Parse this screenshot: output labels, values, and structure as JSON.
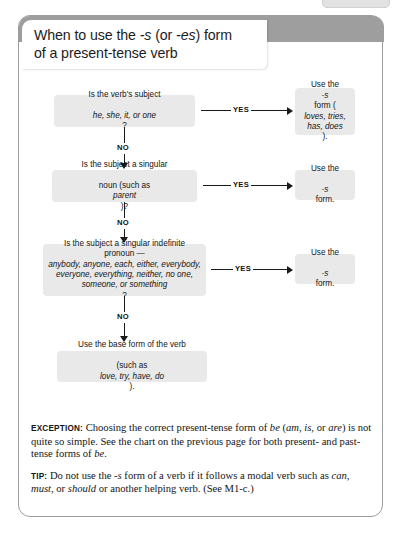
{
  "card": {
    "title_line1_a": "When to use the ",
    "title_line1_s": "-s",
    "title_line1_b": " (or ",
    "title_line1_es": "-es",
    "title_line1_c": ") form",
    "title_line2": "of a present-tense verb",
    "title_full": "When to use the -s (or -es) form of a present-tense verb"
  },
  "flowchart": {
    "type": "decision-flowchart",
    "yes_label": "YES",
    "no_label": "NO",
    "nodes": [
      {
        "id": "q1",
        "kind": "question",
        "line1": "Is the verb's subject",
        "line2_italic": "he, she, it, or one",
        "line2_tail": "?",
        "text": "Is the verb's subject he, she, it, or one?"
      },
      {
        "id": "r1",
        "kind": "result",
        "lead": "Use the ",
        "italic1": "-s",
        "mid": " form (",
        "italic2": "loves, tries, has, does",
        "tail": ").",
        "text": "Use the -s form (loves, tries, has, does)."
      },
      {
        "id": "q2",
        "kind": "question",
        "line1": "Is the subject a singular",
        "line2_a": "noun (such as ",
        "line2_italic": "parent",
        "line2_b": ")?",
        "text": "Is the subject a singular noun (such as parent)?"
      },
      {
        "id": "r2",
        "kind": "result",
        "lead": "Use the ",
        "italic1": "-s",
        "tail": " form.",
        "text": "Use the -s form."
      },
      {
        "id": "q3",
        "kind": "question",
        "lead": "Is the subject a singular indefinite pronoun — ",
        "italic_list": "anybody, anyone, each, either, everybody, everyone, everything, neither, no one, someone, or something",
        "tail": "?",
        "text": "Is the subject a singular indefinite pronoun — anybody, anyone, each, either, everybody, everyone, everything, neither, no one, someone, or something?"
      },
      {
        "id": "r3",
        "kind": "result",
        "lead": "Use the ",
        "italic1": "-s",
        "tail": " form.",
        "text": "Use the -s form."
      },
      {
        "id": "q4",
        "kind": "terminal",
        "line1": "Use the base form of the verb",
        "line2_a": "(such as ",
        "line2_italic": "love, try, have, do",
        "line2_b": ").",
        "text": "Use the base form of the verb (such as love, try, have, do)."
      }
    ]
  },
  "notes": [
    {
      "id": "exception",
      "label": "EXCEPTION:",
      "seg1": " Choosing the correct present-tense form of ",
      "italic1": "be",
      "seg2": " (",
      "italic2": "am, is,",
      "seg3": " or ",
      "italic3": "are",
      "seg4": ") is not quite so simple. See the chart on the previous page for both present- and past-tense forms of ",
      "italic4": "be",
      "seg5": ".",
      "text": "EXCEPTION: Choosing the correct present-tense form of be (am, is, or are) is not quite so simple. See the chart on the previous page for both present- and past-tense forms of be."
    },
    {
      "id": "tip",
      "label": "TIP:",
      "seg1": " Do not use the ",
      "italic1": "-s",
      "seg2": " form of a verb if it follows a modal verb such as ",
      "italic2": "can, must,",
      "seg3": " or ",
      "italic3": "should",
      "seg4": " or another helping verb. (See M1-c.)",
      "text": "TIP: Do not use the -s form of a verb if it follows a modal verb such as can, must, or should or another helping verb. (See M1-c.)"
    }
  ],
  "colors": {
    "card_border": "#9c9c9c",
    "title_band": "#9e9e9e",
    "node_fill": "#e9e9e9",
    "connector": "#1a1a1a",
    "text": "#151515"
  }
}
